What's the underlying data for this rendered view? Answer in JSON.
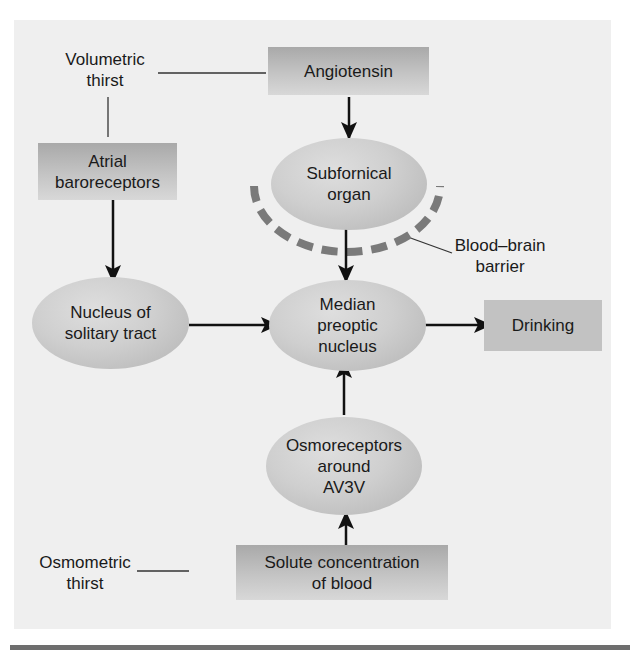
{
  "diagram": {
    "labels": {
      "volumetric_thirst": "Volumetric\nthirst",
      "osmometric_thirst": "Osmometric\nthirst",
      "blood_brain_barrier": "Blood–brain\nbarrier"
    },
    "boxes": {
      "angiotensin": "Angiotensin",
      "atrial_baroreceptors": "Atrial\nbaroreceptors",
      "drinking": "Drinking",
      "solute_concentration": "Solute concentration\nof blood"
    },
    "ovals": {
      "subfornical_organ": "Subfornical\norgan",
      "nucleus_solitary_tract": "Nucleus of\nsolitary tract",
      "median_preoptic_nucleus": "Median\npreoptic\nnucleus",
      "osmoreceptors": "Osmoreceptors\naround\nAV3V"
    },
    "edges": [
      {
        "from": "Angiotensin",
        "to": "Subfornical organ"
      },
      {
        "from": "Subfornical organ",
        "to": "Median preoptic nucleus"
      },
      {
        "from": "Atrial baroreceptors",
        "to": "Nucleus of solitary tract"
      },
      {
        "from": "Nucleus of solitary tract",
        "to": "Median preoptic nucleus"
      },
      {
        "from": "Median preoptic nucleus",
        "to": "Drinking"
      },
      {
        "from": "Osmoreceptors around AV3V",
        "to": "Median preoptic nucleus"
      },
      {
        "from": "Solute concentration of blood",
        "to": "Osmoreceptors around AV3V"
      }
    ],
    "colors": {
      "panel": "#efefef",
      "box": "#c0c0c0",
      "oval": "#cccccc",
      "barrier_dash": "#7a7a7a",
      "arrow": "#111111",
      "rule": "#6e6e6e"
    }
  }
}
